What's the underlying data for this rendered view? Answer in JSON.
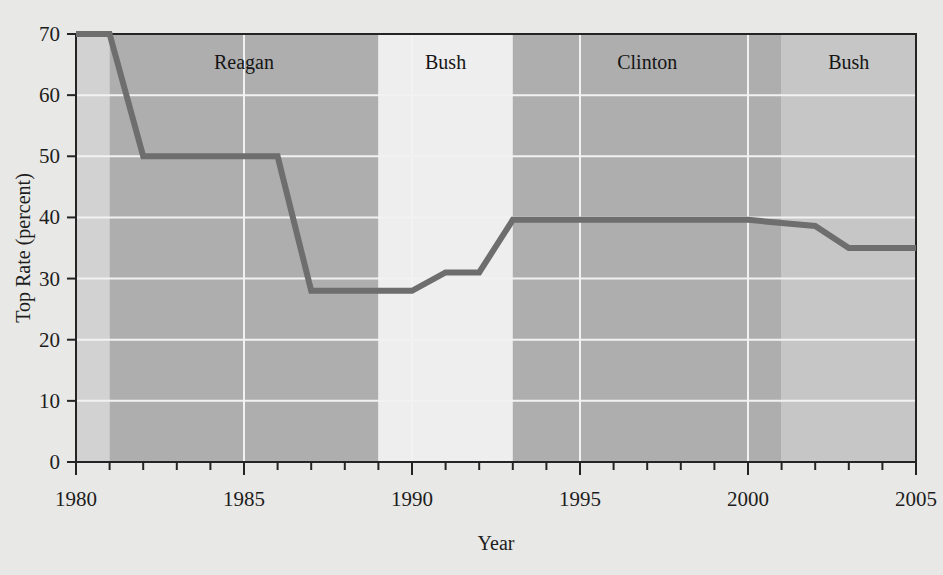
{
  "chart_data": {
    "type": "line",
    "title": "",
    "xlabel": "Year",
    "ylabel": "Top Rate (percent)",
    "xlim": [
      1980,
      2005
    ],
    "ylim": [
      0,
      70
    ],
    "grid": true,
    "legend_position": "none",
    "x_ticks_major": [
      "1980",
      "1985",
      "1990",
      "1995",
      "2000",
      "2005"
    ],
    "x_tick_values_major": [
      1980,
      1985,
      1990,
      1995,
      2000,
      2005
    ],
    "x_minor_tick_step": 1,
    "y_ticks": [
      "0",
      "10",
      "20",
      "30",
      "40",
      "50",
      "60",
      "70"
    ],
    "y_tick_values": [
      0,
      10,
      20,
      30,
      40,
      50,
      60,
      70
    ],
    "series": [
      {
        "name": "Top marginal tax rate",
        "color": "#6e6e6e",
        "x": [
          1980,
          1981,
          1982,
          1983,
          1984,
          1985,
          1986,
          1987,
          1988,
          1989,
          1990,
          1991,
          1992,
          1993,
          1994,
          1995,
          1996,
          1997,
          1998,
          1999,
          2000,
          2001,
          2002,
          2003,
          2004,
          2005
        ],
        "values": [
          70,
          70,
          50,
          50,
          50,
          50,
          50,
          28,
          28,
          28,
          28,
          31,
          31,
          39.6,
          39.6,
          39.6,
          39.6,
          39.6,
          39.6,
          39.6,
          39.6,
          39.1,
          38.6,
          35,
          35,
          35
        ]
      }
    ],
    "bands": [
      {
        "label": "",
        "start": 1980,
        "end": 1981,
        "shade": "#d2d2d2"
      },
      {
        "label": "Reagan",
        "start": 1981,
        "end": 1989,
        "shade": "#aeaeae"
      },
      {
        "label": "Bush",
        "start": 1989,
        "end": 1993,
        "shade": "#eeeeee"
      },
      {
        "label": "Clinton",
        "start": 1993,
        "end": 2001,
        "shade": "#aeaeae"
      },
      {
        "label": "Bush",
        "start": 2001,
        "end": 2005,
        "shade": "#c6c6c6"
      }
    ]
  },
  "colors": {
    "page_background": "#e8e8e6",
    "line": "#6e6e6e",
    "gridline": "#f2f2f2",
    "axis": "#242424",
    "text": "#1d1d1d"
  }
}
